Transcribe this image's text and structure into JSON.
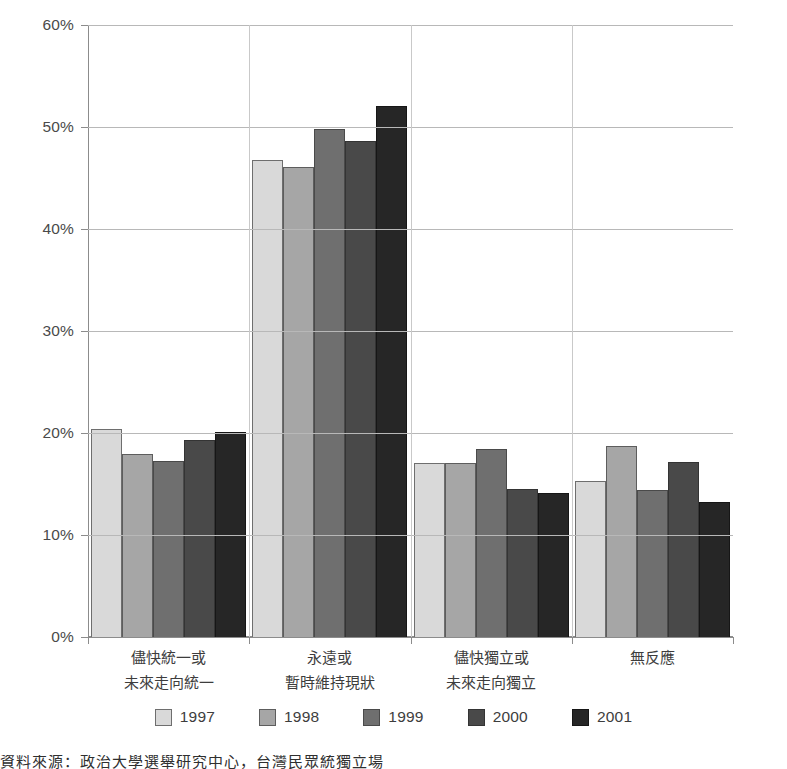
{
  "chart_data": {
    "type": "bar",
    "title": "",
    "xlabel": "",
    "ylabel": "",
    "ylim": [
      0,
      60
    ],
    "ytick_labels": [
      "0%",
      "10%",
      "20%",
      "30%",
      "40%",
      "50%",
      "60%"
    ],
    "ytick_values": [
      0,
      10,
      20,
      30,
      40,
      50,
      60
    ],
    "grid": true,
    "legend_position": "bottom",
    "categories": [
      "儘快統一或\n未來走向統一",
      "永遠或\n暫時維持現狀",
      "儘快獨立或\n未來走向獨立",
      "無反應"
    ],
    "category_lines": [
      [
        "儘快統一或",
        "未來走向統一"
      ],
      [
        "永遠或",
        "暫時維持現狀"
      ],
      [
        "儘快獨立或",
        "未來走向獨立"
      ],
      [
        "無反應"
      ]
    ],
    "series": [
      {
        "name": "1997",
        "color": "#d9d9d9",
        "values": [
          20.4,
          46.8,
          17.1,
          15.3
        ]
      },
      {
        "name": "1998",
        "color": "#a6a6a6",
        "values": [
          17.9,
          46.1,
          17.1,
          18.7
        ]
      },
      {
        "name": "1999",
        "color": "#6f6f6f",
        "values": [
          17.3,
          49.8,
          18.4,
          14.4
        ]
      },
      {
        "name": "2000",
        "color": "#494949",
        "values": [
          19.3,
          48.6,
          14.5,
          17.2
        ]
      },
      {
        "name": "2001",
        "color": "#262626",
        "values": [
          20.1,
          52.1,
          14.1,
          13.2
        ]
      }
    ]
  },
  "legend": {
    "items": [
      {
        "label": "1997"
      },
      {
        "label": "1998"
      },
      {
        "label": "1999"
      },
      {
        "label": "2000"
      },
      {
        "label": "2001"
      }
    ]
  },
  "page_footer": {
    "partial_text": "資料來源：政治大學選舉研究中心，台灣民眾統獨立場"
  }
}
